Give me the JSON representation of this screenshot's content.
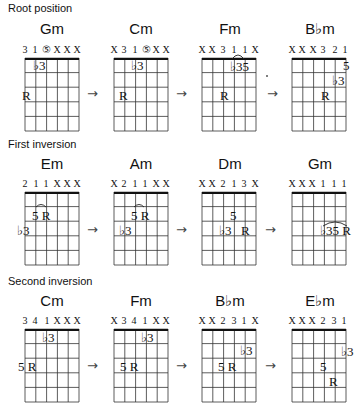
{
  "sections": [
    {
      "title": "Root position",
      "chords": [
        {
          "name": "Gm",
          "fingering": [
            "3",
            "1",
            "⑤",
            "X",
            "X",
            "X"
          ],
          "notes": [
            {
              "label": "♭3",
              "string": 1,
              "fret": 1
            },
            {
              "label": "R",
              "string": 0,
              "fret": 3
            }
          ],
          "barre": null
        },
        {
          "name": "Cm",
          "fingering": [
            "X",
            "3",
            "1",
            "⑤",
            "X",
            "X"
          ],
          "notes": [
            {
              "label": "♭3",
              "string": 2,
              "fret": 1
            },
            {
              "label": "R",
              "string": 1,
              "fret": 3
            }
          ],
          "barre": null
        },
        {
          "name": "Fm",
          "fingering": [
            "X",
            "X",
            "3",
            "1",
            "1",
            "X"
          ],
          "notes": [
            {
              "label": "♭35",
              "string": 3,
              "fret": 1
            },
            {
              "label": "R",
              "string": 2,
              "fret": 3
            }
          ],
          "barre": "1-1 tie (strings 4-5)"
        },
        {
          "name": "B♭m",
          "fingering": [
            "X",
            "X",
            "X",
            "3",
            "2",
            "1"
          ],
          "notes": [
            {
              "label": "5",
              "string": 5,
              "fret": 1
            },
            {
              "label": "♭3",
              "string": 4,
              "fret": 2
            },
            {
              "label": "R",
              "string": 3,
              "fret": 3
            }
          ],
          "barre": null
        }
      ]
    },
    {
      "title": "First inversion",
      "chords": [
        {
          "name": "Em",
          "fingering": [
            "2",
            "1",
            "1",
            "X",
            "X",
            "X"
          ],
          "notes": [
            {
              "label": "5",
              "string": 1,
              "fret": 2
            },
            {
              "label": "R",
              "string": 2,
              "fret": 2
            },
            {
              "label": "♭3",
              "string": 0,
              "fret": 3
            }
          ],
          "barre": "arch over 5 R"
        },
        {
          "name": "Am",
          "fingering": [
            "X",
            "2",
            "1",
            "1",
            "X",
            "X"
          ],
          "notes": [
            {
              "label": "5",
              "string": 2,
              "fret": 2
            },
            {
              "label": "R",
              "string": 3,
              "fret": 2
            },
            {
              "label": "♭3",
              "string": 1,
              "fret": 3
            }
          ],
          "barre": "arch over 5 R"
        },
        {
          "name": "Dm",
          "fingering": [
            "X",
            "X",
            "2",
            "1",
            "3",
            "X"
          ],
          "notes": [
            {
              "label": "5",
              "string": 3,
              "fret": 2
            },
            {
              "label": "♭3",
              "string": 2,
              "fret": 3
            },
            {
              "label": "R",
              "string": 4,
              "fret": 3
            }
          ],
          "barre": null
        },
        {
          "name": "Gm",
          "fingering": [
            "X",
            "X",
            "X",
            "1",
            "1",
            "1"
          ],
          "notes": [
            {
              "label": "♭35",
              "string": 3,
              "fret": 3
            },
            {
              "label": "R",
              "string": 5,
              "fret": 3
            }
          ],
          "barre": "arch over ♭3 5 R"
        }
      ]
    },
    {
      "title": "Second inversion",
      "chords": [
        {
          "name": "Cm",
          "fingering": [
            "3",
            "4",
            "1",
            "X",
            "X",
            "X"
          ],
          "notes": [
            {
              "label": "♭3",
              "string": 2,
              "fret": 1
            },
            {
              "label": "5",
              "string": 0,
              "fret": 3
            },
            {
              "label": "R",
              "string": 1,
              "fret": 3
            }
          ],
          "barre": null
        },
        {
          "name": "Fm",
          "fingering": [
            "X",
            "3",
            "4",
            "1",
            "X",
            "X"
          ],
          "notes": [
            {
              "label": "♭3",
              "string": 3,
              "fret": 1
            },
            {
              "label": "5",
              "string": 1,
              "fret": 3
            },
            {
              "label": "R",
              "string": 2,
              "fret": 3
            }
          ],
          "barre": null
        },
        {
          "name": "B♭m",
          "fingering": [
            "X",
            "X",
            "2",
            "3",
            "1",
            "X"
          ],
          "notes": [
            {
              "label": "♭3",
              "string": 4,
              "fret": 2
            },
            {
              "label": "5",
              "string": 2,
              "fret": 3
            },
            {
              "label": "R",
              "string": 3,
              "fret": 3
            }
          ],
          "barre": null
        },
        {
          "name": "E♭m",
          "fingering": [
            "X",
            "X",
            "X",
            "2",
            "3",
            "1"
          ],
          "notes": [
            {
              "label": "♭3",
              "string": 5,
              "fret": 2
            },
            {
              "label": "5",
              "string": 4,
              "fret": 3
            },
            {
              "label": "R",
              "string": 4,
              "fret": 4
            }
          ],
          "barre": null
        }
      ]
    }
  ],
  "arrow_glyph": "→"
}
